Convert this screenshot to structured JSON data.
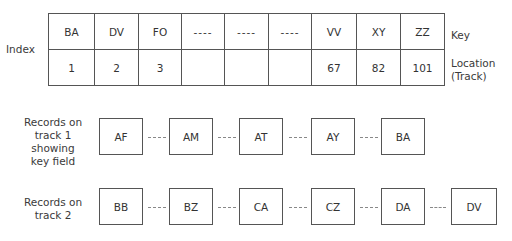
{
  "index": {
    "label": "Index",
    "key_label": "Key",
    "location_label_line1": "Location",
    "location_label_line2": "(Track)",
    "columns": [
      {
        "key": "BA",
        "track": "1"
      },
      {
        "key": "DV",
        "track": "2"
      },
      {
        "key": "FO",
        "track": "3"
      },
      {
        "key": "----",
        "track": ""
      },
      {
        "key": "----",
        "track": ""
      },
      {
        "key": "----",
        "track": ""
      },
      {
        "key": "VV",
        "track": "67"
      },
      {
        "key": "XY",
        "track": "82"
      },
      {
        "key": "ZZ",
        "track": "101"
      }
    ]
  },
  "track1": {
    "label_line1": "Records on",
    "label_line2": "track 1 showing",
    "label_line3": "key field",
    "records": [
      "AF",
      "AM",
      "AT",
      "AY",
      "BA"
    ]
  },
  "track2": {
    "label_line1": "Records on",
    "label_line2": "track 2",
    "records": [
      "BB",
      "BZ",
      "CA",
      "CZ",
      "DA",
      "DV"
    ]
  }
}
